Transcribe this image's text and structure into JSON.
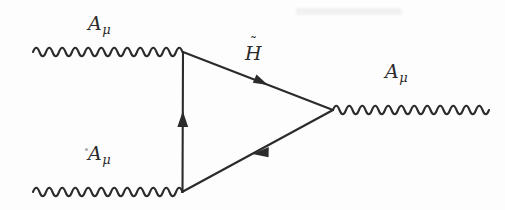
{
  "figure": {
    "kind": "feynman-diagram",
    "title": "",
    "width": 505,
    "height": 210,
    "background_color": "#fdfdfd",
    "ink_color": "#2b2b2b"
  },
  "labels": {
    "photon_in_top": {
      "base": "A",
      "subscript": "μ",
      "x": 88,
      "y": 14
    },
    "photon_in_bottom": {
      "base": "A",
      "subscript": "μ",
      "x": 88,
      "y": 144
    },
    "higgsino": {
      "base": "H",
      "subscript": "",
      "tilde": "˜",
      "x": 245,
      "y": 44
    },
    "photon_out": {
      "base": "A",
      "subscript": "μ",
      "x": 385,
      "y": 62
    }
  },
  "vertices": {
    "top_left": {
      "x": 183,
      "y": 52
    },
    "bottom_left": {
      "x": 182,
      "y": 192
    },
    "right": {
      "x": 333,
      "y": 110
    }
  },
  "photon_lines": [
    {
      "name": "incoming-photon-top",
      "x_start": 33,
      "x_end": 183,
      "y": 52,
      "amplitude": 7,
      "period": 26
    },
    {
      "name": "incoming-photon-bottom",
      "x_start": 33,
      "x_end": 182,
      "y": 192,
      "amplitude": 7,
      "period": 26
    },
    {
      "name": "outgoing-photon-right",
      "x_start": 333,
      "x_end": 487,
      "y": 110,
      "amplitude": 7,
      "period": 26
    }
  ],
  "fermion_lines": [
    {
      "name": "higgsino-upper",
      "from": "top_left",
      "to": "right",
      "arrow_direction": "toward-right-vertex",
      "arrow_t": 0.53
    },
    {
      "name": "higgsino-lower",
      "from": "right",
      "to": "bottom_left",
      "arrow_direction": "toward-bottom-left-vertex",
      "arrow_t": 0.57
    },
    {
      "name": "higgsino-vertical",
      "from": "bottom_left",
      "to": "top_left",
      "arrow_direction": "upward",
      "arrow_t": 0.52
    }
  ],
  "artifacts": {
    "top_smudge": {
      "x": 296,
      "y": 8,
      "width": 106,
      "height": 7
    },
    "speck_near_bottom_label": {
      "x": 85,
      "y": 148,
      "size": 3
    }
  }
}
